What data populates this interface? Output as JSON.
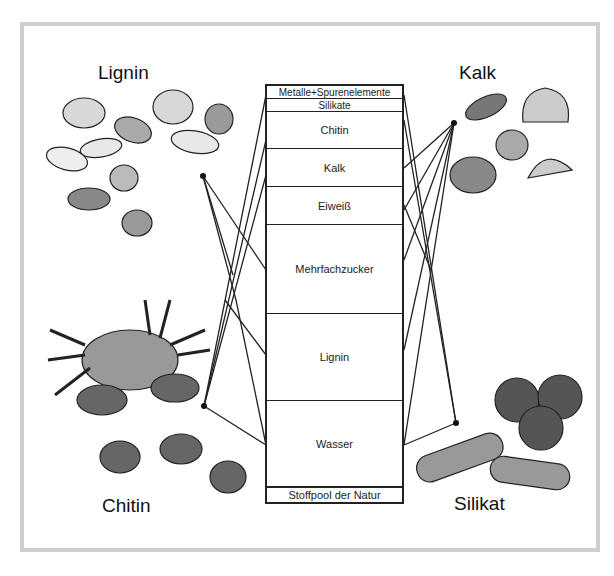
{
  "diagram": {
    "title_box": "Stoffpool der Natur",
    "pool_rows": [
      {
        "label": "Metalle+Spurenelemente",
        "height": 13
      },
      {
        "label": "Silikate",
        "height": 13
      },
      {
        "label": "Chitin",
        "height": 37
      },
      {
        "label": "Kalk",
        "height": 38
      },
      {
        "label": "Eiweiß",
        "height": 38
      },
      {
        "label": "Mehrfachzucker",
        "height": 89
      },
      {
        "label": "Lignin",
        "height": 87
      },
      {
        "label": "Wasser",
        "height": 85
      },
      {
        "label": "Stoffpool der Natur",
        "height": 15
      }
    ],
    "groups": {
      "lignin": {
        "label": "Lignin",
        "illustration": "nuts-icon"
      },
      "kalk": {
        "label": "Kalk",
        "illustration": "shells-icon"
      },
      "chitin": {
        "label": "Chitin",
        "illustration": "crab-icon"
      },
      "silikat": {
        "label": "Silikat",
        "illustration": "sponges-icon"
      }
    },
    "colors": {
      "line": "#222222",
      "frame": "#cfcfcf",
      "fill": "#ffffff"
    }
  }
}
